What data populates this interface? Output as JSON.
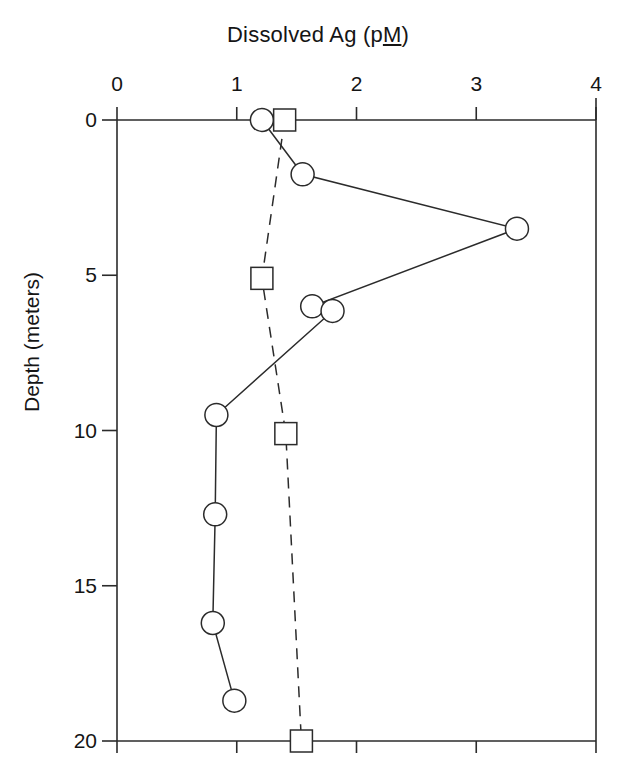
{
  "chart_data": {
    "type": "line",
    "title": "Dissolved Ag (pM)",
    "title_prefix": "Dissolved Ag (p",
    "title_underlined": "M",
    "title_suffix": ")",
    "xlabel": "Dissolved Ag (pM)",
    "ylabel": "Depth (meters)",
    "xlim": [
      0,
      4
    ],
    "ylim": [
      0,
      20
    ],
    "y_inverted": true,
    "grid": false,
    "legend": "none",
    "xticks": [
      0,
      1,
      2,
      3,
      4
    ],
    "xtick_labels": [
      "0",
      "1",
      "2",
      "3",
      "4"
    ],
    "yticks": [
      0,
      5,
      10,
      15,
      20
    ],
    "ytick_labels": [
      "0",
      "5",
      "10",
      "15",
      "20"
    ],
    "axis_color": "#2b2b2b",
    "series": [
      {
        "name": "circle-series",
        "marker": "open-circle",
        "linestyle": "solid",
        "color": "#2b2b2b",
        "x": [
          1.21,
          1.55,
          3.34,
          1.63,
          1.8,
          0.83,
          0.82,
          0.8,
          0.98
        ],
        "y": [
          0.0,
          1.75,
          3.5,
          6.0,
          6.15,
          9.5,
          12.7,
          16.2,
          18.7
        ]
      },
      {
        "name": "square-series",
        "marker": "open-square",
        "linestyle": "dashed",
        "color": "#2b2b2b",
        "x": [
          1.4,
          1.21,
          1.41,
          1.54
        ],
        "y": [
          0.0,
          5.1,
          10.1,
          20.0
        ]
      }
    ]
  }
}
